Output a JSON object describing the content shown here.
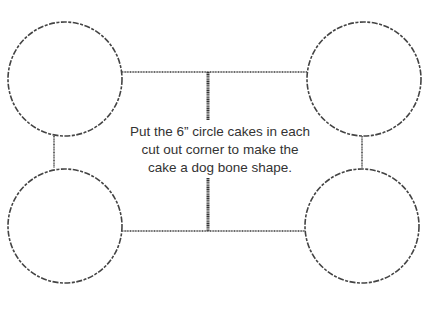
{
  "diagram": {
    "instruction_lines": [
      "Put the 6” circle cakes in each",
      "cut out corner to make the",
      "cake a dog bone shape."
    ],
    "colors": {
      "line": "#5a5a5a",
      "circle_stroke": "#444444",
      "center_post": "#333333",
      "text": "#333333",
      "background": "#ffffff"
    },
    "circles": [
      {
        "id": "top-left",
        "cx": 65,
        "cy": 79,
        "r": 57
      },
      {
        "id": "top-right",
        "cx": 364,
        "cy": 79,
        "r": 57
      },
      {
        "id": "bottom-left",
        "cx": 65,
        "cy": 226,
        "r": 57
      },
      {
        "id": "bottom-right",
        "cx": 362,
        "cy": 226,
        "r": 57
      }
    ]
  }
}
